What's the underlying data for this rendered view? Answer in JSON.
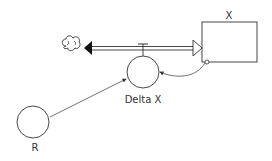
{
  "diagram": {
    "type": "stock-and-flow",
    "stock": {
      "label": "X"
    },
    "flow": {
      "label": "Delta X",
      "direction": "outflow from X to cloud"
    },
    "auxiliary": {
      "label": "R"
    },
    "source_sink": {
      "icon": "cloud-icon"
    },
    "connectors": [
      {
        "from": "R",
        "to": "Delta X"
      },
      {
        "from": "X",
        "to": "Delta X"
      }
    ],
    "colors": {
      "line": "#333333",
      "background": "#ffffff"
    }
  }
}
